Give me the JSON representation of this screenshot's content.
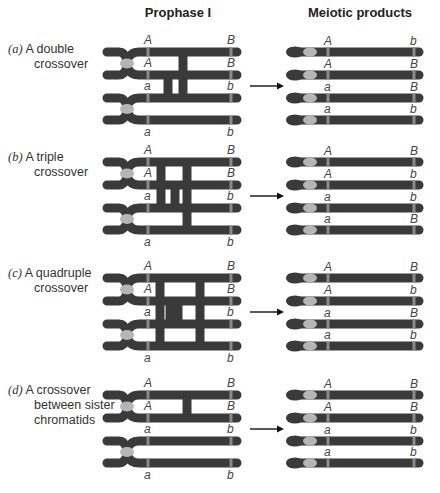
{
  "titles": {
    "prophase": "Prophase I",
    "products": "Meiotic products"
  },
  "colors": {
    "chromatid": "#3a3a3a",
    "centromere": "#b5b5b5",
    "locus_band": "#8a8a8a",
    "label": "#333333"
  },
  "panels": [
    {
      "id": "a",
      "letter": "(a)",
      "line1": "A double",
      "line2": "crossover",
      "prophase_top_labels": [
        "A",
        "B"
      ],
      "prophase_labels": [
        [
          "A",
          "B"
        ],
        [
          "A",
          "B"
        ],
        [
          "a",
          "b"
        ],
        [
          "a",
          "b"
        ]
      ],
      "products": [
        [
          "A",
          "b"
        ],
        [
          "A",
          "B"
        ],
        [
          "a",
          "B"
        ],
        [
          "a",
          "b"
        ]
      ]
    },
    {
      "id": "b",
      "letter": "(b)",
      "line1": "A triple",
      "line2": "crossover",
      "prophase_labels": [
        [
          "A",
          "B"
        ],
        [
          "A",
          "B"
        ],
        [
          "a",
          "b"
        ],
        [
          "a",
          "b"
        ]
      ],
      "products": [
        [
          "A",
          "B"
        ],
        [
          "A",
          "b"
        ],
        [
          "a",
          "b"
        ],
        [
          "a",
          "B"
        ]
      ]
    },
    {
      "id": "c",
      "letter": "(c)",
      "line1": "A quadruple",
      "line2": "crossover",
      "prophase_labels": [
        [
          "A",
          "B"
        ],
        [
          "A",
          "B"
        ],
        [
          "a",
          "b"
        ],
        [
          "a",
          "b"
        ]
      ],
      "products": [
        [
          "A",
          "B"
        ],
        [
          "A",
          "b"
        ],
        [
          "a",
          "B"
        ],
        [
          "a",
          "b"
        ]
      ]
    },
    {
      "id": "d",
      "letter": "(d)",
      "line1": "A crossover",
      "line2": "between sister",
      "line3": "chromatids",
      "prophase_labels": [
        [
          "A",
          "B"
        ],
        [
          "A",
          "B"
        ],
        [
          "a",
          "b"
        ],
        [
          "a",
          "b"
        ]
      ],
      "products": [
        [
          "A",
          "B"
        ],
        [
          "A",
          "B"
        ],
        [
          "a",
          "b"
        ],
        [
          "a",
          "b"
        ]
      ]
    }
  ]
}
